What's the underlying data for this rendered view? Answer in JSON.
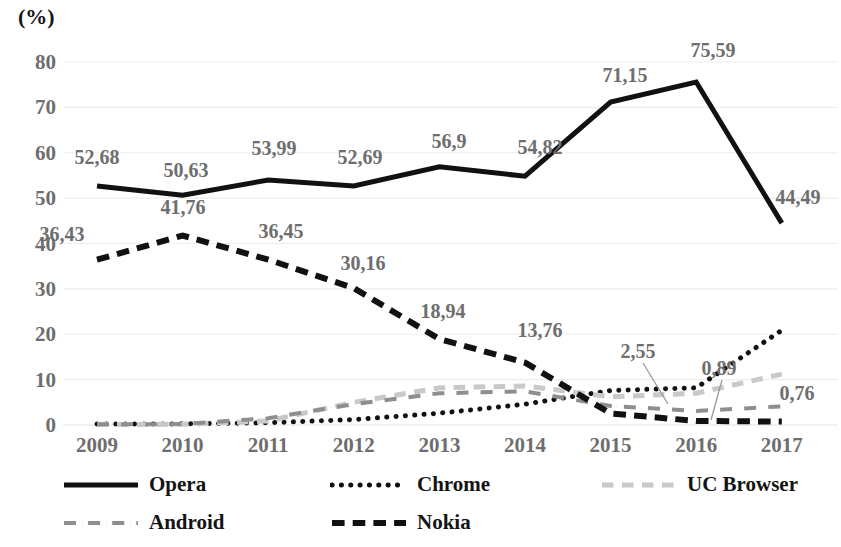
{
  "chart_data": {
    "type": "line",
    "title": "",
    "subtitle": "",
    "xlabel": "",
    "ylabel": "(%)",
    "ylim": [
      0,
      80
    ],
    "ytick_step": 10,
    "grid": true,
    "legend_position": "bottom",
    "categories": [
      "2009",
      "2010",
      "2011",
      "2012",
      "2013",
      "2014",
      "2015",
      "2016",
      "2017"
    ],
    "yticks": [
      "0",
      "10",
      "20",
      "30",
      "40",
      "50",
      "60",
      "70",
      "80"
    ],
    "decimal_separator": ",",
    "series": [
      {
        "name": "Opera",
        "style": "solid",
        "color": "#111111",
        "width": 5,
        "values": [
          52.68,
          50.63,
          53.99,
          52.69,
          56.9,
          54.82,
          71.15,
          75.59,
          44.49
        ],
        "labels": [
          "52,68",
          "50,63",
          "53,99",
          "52,69",
          "56,9",
          "54,82",
          "71,15",
          "75,59",
          "44,49"
        ]
      },
      {
        "name": "Chrome",
        "style": "dotted",
        "color": "#111111",
        "width": 5,
        "values": [
          0.2,
          0.25,
          0.5,
          1.2,
          2.6,
          4.6,
          7.6,
          8.2,
          20.9
        ],
        "labels": []
      },
      {
        "name": "UC Browser",
        "style": "dashed-light",
        "color": "#c9c9c9",
        "width": 5,
        "values": [
          0.1,
          0.15,
          0.9,
          5.0,
          8.2,
          8.6,
          6.2,
          7.0,
          11.2
        ],
        "labels": []
      },
      {
        "name": "Android",
        "style": "dashdot",
        "color": "#8e8e8e",
        "width": 4,
        "values": [
          0.15,
          0.2,
          1.5,
          4.6,
          7.0,
          7.4,
          4.2,
          3.1,
          4.1
        ],
        "labels": []
      },
      {
        "name": "Nokia",
        "style": "dashed",
        "color": "#111111",
        "width": 6,
        "values": [
          36.43,
          41.76,
          36.45,
          30.16,
          18.94,
          13.76,
          2.55,
          0.89,
          0.76
        ],
        "labels": [
          "36,43",
          "41,76",
          "36,45",
          "30,16",
          "18,94",
          "13,76",
          "2,55",
          "0,89",
          "0,76"
        ]
      }
    ],
    "data_labels": [
      {
        "text": "52,68",
        "series": "Opera",
        "x": 97,
        "y": 157
      },
      {
        "text": "50,63",
        "series": "Opera",
        "x": 186,
        "y": 170
      },
      {
        "text": "53,99",
        "series": "Opera",
        "x": 274,
        "y": 148
      },
      {
        "text": "52,69",
        "series": "Opera",
        "x": 360,
        "y": 157
      },
      {
        "text": "56,9",
        "series": "Opera",
        "x": 449,
        "y": 141
      },
      {
        "text": "54,82",
        "series": "Opera",
        "x": 540,
        "y": 147
      },
      {
        "text": "71,15",
        "series": "Opera",
        "x": 625,
        "y": 75
      },
      {
        "text": "75,59",
        "series": "Opera",
        "x": 713,
        "y": 50
      },
      {
        "text": "44,49",
        "series": "Opera",
        "x": 798,
        "y": 197
      },
      {
        "text": "36,43",
        "series": "Nokia",
        "x": 62,
        "y": 234
      },
      {
        "text": "41,76",
        "series": "Nokia",
        "x": 183,
        "y": 207
      },
      {
        "text": "36,45",
        "series": "Nokia",
        "x": 281,
        "y": 231
      },
      {
        "text": "30,16",
        "series": "Nokia",
        "x": 363,
        "y": 263
      },
      {
        "text": "18,94",
        "series": "Nokia",
        "x": 443,
        "y": 311
      },
      {
        "text": "13,76",
        "series": "Nokia",
        "x": 540,
        "y": 330
      },
      {
        "text": "2,55",
        "series": "Nokia",
        "x": 638,
        "y": 351
      },
      {
        "text": "0,89",
        "series": "Nokia",
        "x": 719,
        "y": 368
      },
      {
        "text": "0,76",
        "series": "Nokia",
        "x": 797,
        "y": 393
      }
    ],
    "leader_lines": [
      {
        "label": "2,55",
        "x1": 643,
        "y1": 363,
        "x2": 668,
        "y2": 404
      },
      {
        "label": "0,89",
        "x1": 722,
        "y1": 380,
        "x2": 711,
        "y2": 420
      }
    ]
  },
  "legend": {
    "items": [
      {
        "label": "Opera",
        "style": "solid",
        "color": "#111111"
      },
      {
        "label": "Chrome",
        "style": "dotted",
        "color": "#111111"
      },
      {
        "label": "UC Browser",
        "style": "dashed-light",
        "color": "#c9c9c9"
      },
      {
        "label": "Android",
        "style": "dashdot",
        "color": "#8e8e8e"
      },
      {
        "label": "Nokia",
        "style": "dashed",
        "color": "#111111"
      }
    ]
  }
}
